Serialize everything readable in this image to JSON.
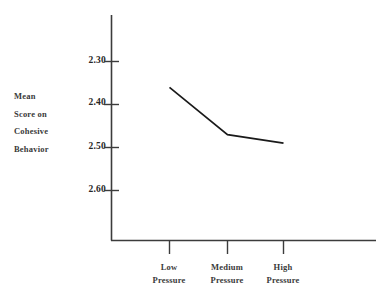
{
  "chart_data": {
    "type": "line",
    "title": "",
    "subtitle": "",
    "xlabel": "",
    "ylabel": "Mean Score on Cohesive Behavior",
    "ylabel_lines": [
      "Mean",
      "Score on",
      "Cohesive",
      "Behavior"
    ],
    "categories": [
      "Low Pressure",
      "Medium Pressure",
      "High Pressure"
    ],
    "category_lines": [
      [
        "Low",
        "Pressure"
      ],
      [
        "Medium",
        "Pressure"
      ],
      [
        "High",
        "Pressure"
      ]
    ],
    "values": [
      2.36,
      2.47,
      2.49
    ],
    "ylim": [
      2.3,
      2.6
    ],
    "y_inverted": true,
    "yticks": [
      2.3,
      2.4,
      2.5,
      2.6
    ],
    "ytick_labels": [
      "2.30",
      "2.40",
      "2.50",
      "2.60"
    ],
    "grid": false,
    "legend": null,
    "series": [
      {
        "name": "Mean Score on Cohesive Behavior",
        "values": [
          2.36,
          2.47,
          2.49
        ],
        "color": "#1a1a1a"
      }
    ],
    "colors": {
      "line": "#1a1a1a",
      "axis": "#3c3c3c",
      "text": "#2b2b2b",
      "background": "#ffffff"
    }
  }
}
